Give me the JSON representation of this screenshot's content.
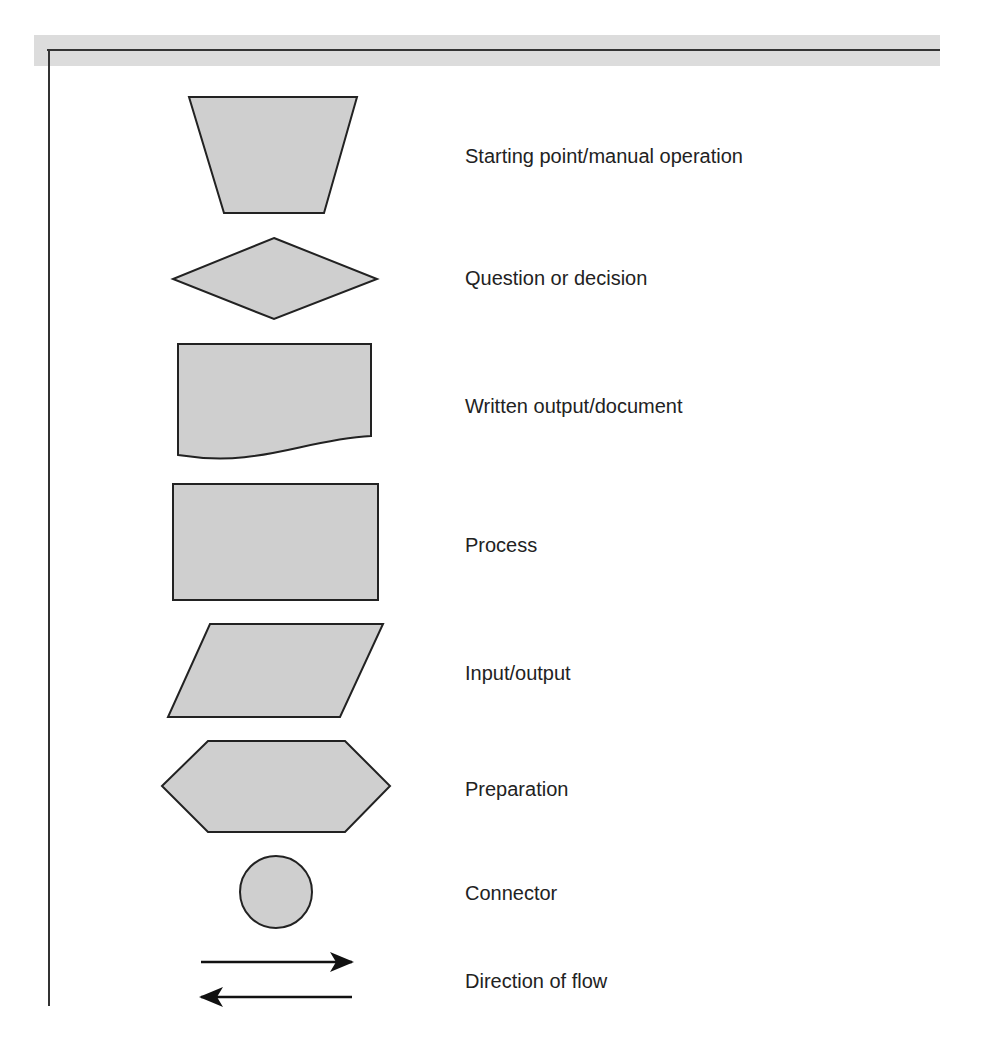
{
  "diagram": {
    "type": "flowchart-symbol-legend",
    "colors": {
      "shape_fill": "#cfcfcf",
      "shape_stroke": "#222222",
      "band": "#dcdcdc",
      "frame": "#333333",
      "text": "#222222"
    },
    "symbols": [
      {
        "shape": "trapezoid",
        "icon": "trapezoid-icon",
        "label": "Starting point/manual operation"
      },
      {
        "shape": "diamond",
        "icon": "diamond-icon",
        "label": "Question or decision"
      },
      {
        "shape": "document",
        "icon": "document-icon",
        "label": "Written output/document"
      },
      {
        "shape": "rectangle",
        "icon": "rectangle-icon",
        "label": "Process"
      },
      {
        "shape": "parallelogram",
        "icon": "parallelogram-icon",
        "label": "Input/output"
      },
      {
        "shape": "hexagon",
        "icon": "hexagon-icon",
        "label": "Preparation"
      },
      {
        "shape": "circle",
        "icon": "circle-icon",
        "label": "Connector"
      },
      {
        "shape": "arrows",
        "icon": "arrows-icon",
        "label": "Direction of flow"
      }
    ]
  }
}
